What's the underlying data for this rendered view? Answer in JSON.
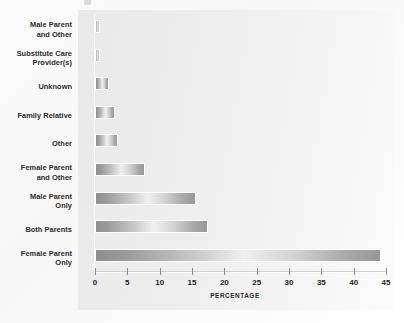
{
  "chart_data": {
    "type": "bar",
    "orientation": "horizontal",
    "title": "",
    "xlabel": "PERCENTAGE",
    "ylabel": "",
    "xlim": [
      0,
      45
    ],
    "xticks": [
      0,
      5,
      10,
      15,
      20,
      25,
      30,
      35,
      40,
      45
    ],
    "grid": false,
    "legend": null,
    "categories": [
      "Male Parent and Other",
      "Substitute Care Provider(s)",
      "Unknown",
      "Family Relative",
      "Other",
      "Female Parent and Other",
      "Male Parent Only",
      "Both Parents",
      "Female Parent Only"
    ],
    "values": [
      0.7,
      0.7,
      2.1,
      3.1,
      3.6,
      7.8,
      15.6,
      17.5,
      44.2
    ],
    "bars": [
      {
        "label_lines": [
          "Male Parent",
          "and Other"
        ],
        "value": 0.7
      },
      {
        "label_lines": [
          "Substitute Care",
          "Provider(s)"
        ],
        "value": 0.7
      },
      {
        "label_lines": [
          "Unknown"
        ],
        "value": 2.1
      },
      {
        "label_lines": [
          "Family Relative"
        ],
        "value": 3.1
      },
      {
        "label_lines": [
          "Other"
        ],
        "value": 3.6
      },
      {
        "label_lines": [
          "Female Parent",
          "and Other"
        ],
        "value": 7.8
      },
      {
        "label_lines": [
          "Male Parent",
          "Only"
        ],
        "value": 15.6
      },
      {
        "label_lines": [
          "Both Parents"
        ],
        "value": 17.5
      },
      {
        "label_lines": [
          "Female Parent",
          "Only"
        ],
        "value": 44.2
      }
    ],
    "colors": {
      "plot_background": "#ededed",
      "page_background": "#ffffff",
      "bar_dark": "#8f8f8f",
      "bar_light": "#f0f0f0",
      "axis": "#8e8e8e",
      "text": "#1f1f1f"
    }
  }
}
